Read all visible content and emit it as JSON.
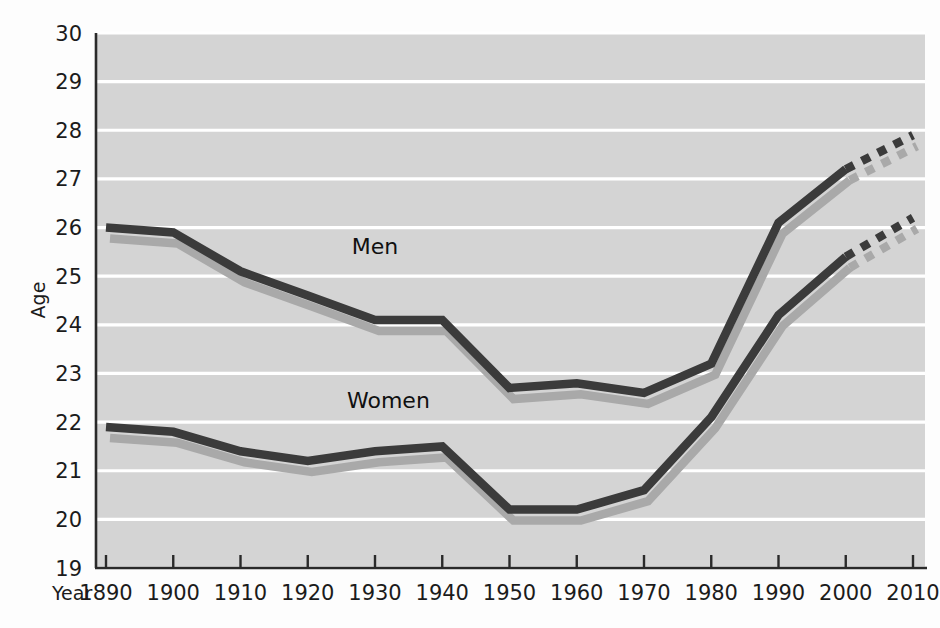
{
  "chart_data": {
    "type": "line",
    "title": "",
    "xlabel": "Year",
    "ylabel": "Age",
    "x": [
      1890,
      1900,
      1910,
      1920,
      1930,
      1940,
      1950,
      1960,
      1970,
      1980,
      1990,
      2000,
      2010
    ],
    "xtick_labels": [
      "1890",
      "1900",
      "1910",
      "1920",
      "1930",
      "1940",
      "1950",
      "1960",
      "1970",
      "1980",
      "1990",
      "2000",
      "2010"
    ],
    "ytick_labels": [
      "19",
      "20",
      "21",
      "22",
      "23",
      "24",
      "25",
      "26",
      "27",
      "28",
      "29",
      "30"
    ],
    "ylim": [
      19,
      30
    ],
    "xlim": [
      1890,
      2010
    ],
    "ytick_step": 1,
    "grid": true,
    "grid_color": "#ffffff",
    "plot_background": "#d4d4d4",
    "legend_position": "inline-labels",
    "series": [
      {
        "name": "Men",
        "label": "Men",
        "color": "#3b3b3b",
        "shadow_color": "#a9a9a9",
        "values": [
          26.0,
          25.9,
          25.1,
          24.6,
          24.1,
          24.1,
          22.7,
          22.8,
          22.6,
          23.2,
          26.1,
          27.2,
          27.9
        ],
        "solid_through": 2000,
        "projected_from": 2000,
        "projection_style": "dashed",
        "label_x": 1930,
        "label_y": 25.45
      },
      {
        "name": "Women",
        "label": "Women",
        "color": "#3b3b3b",
        "shadow_color": "#a9a9a9",
        "values": [
          21.9,
          21.8,
          21.4,
          21.2,
          21.4,
          21.5,
          20.2,
          20.2,
          20.6,
          22.1,
          24.2,
          25.4,
          26.2
        ],
        "solid_through": 2000,
        "projected_from": 2000,
        "projection_style": "dashed",
        "label_x": 1932,
        "label_y": 22.3
      }
    ],
    "annotations": [
      {
        "text": "Men",
        "series": "Men"
      },
      {
        "text": "Women",
        "series": "Women"
      }
    ]
  }
}
